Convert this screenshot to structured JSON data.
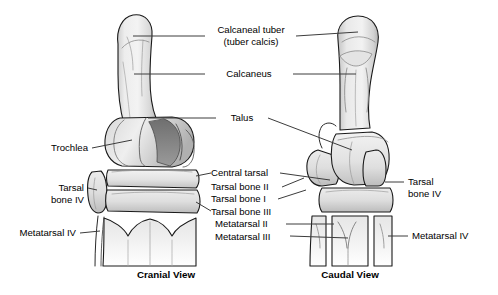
{
  "figure": {
    "background_color": "#ffffff",
    "line_color": "#1a1a1a",
    "leader_color": "#3c3c3c",
    "bone_fill_light": "#f0f0f0",
    "bone_fill_mid": "#dcdcdc",
    "bone_fill_dark": "#b8b8b8",
    "shadow_color": "#6e6e6e"
  },
  "captions": {
    "left": "Cranial View",
    "right": "Caudal View"
  },
  "labels": {
    "calcaneal_tuber_line1": "Calcaneal tuber",
    "calcaneal_tuber_line2": "(tuber calcis)",
    "calcaneus": "Calcaneus",
    "talus": "Talus",
    "trochlea": "Trochlea",
    "tarsal_bone_iv_left_line1": "Tarsal",
    "tarsal_bone_iv_left_line2": "bone IV",
    "metatarsal_iv_left": "Metatarsal IV",
    "central_tarsal": "Central tarsal",
    "tarsal_bone_ii": "Tarsal bone II",
    "tarsal_bone_i": "Tarsal bone I",
    "tarsal_bone_iii": "Tarsal bone III",
    "metatarsal_ii": "Metatarsal II",
    "metatarsal_iii": "Metatarsal III",
    "tarsal_bone_iv_right_line1": "Tarsal",
    "tarsal_bone_iv_right_line2": "bone IV",
    "metatarsal_iv_right": "Metatarsal IV"
  }
}
